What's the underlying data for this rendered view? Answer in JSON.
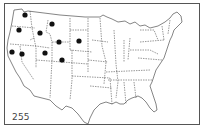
{
  "figure": {
    "type": "us-state-dot-map",
    "label": "255",
    "colors": {
      "outline": "#333333",
      "dot": "#111111",
      "background": "#ffffff",
      "frame": "#555555"
    },
    "marked_states": [
      {
        "state": "Washington",
        "x": 25,
        "y": 15
      },
      {
        "state": "Oregon",
        "x": 19,
        "y": 30
      },
      {
        "state": "Idaho",
        "x": 40,
        "y": 33
      },
      {
        "state": "Montana",
        "x": 52,
        "y": 24
      },
      {
        "state": "Wyoming",
        "x": 59,
        "y": 42
      },
      {
        "state": "South Dakota",
        "x": 79,
        "y": 41
      },
      {
        "state": "California",
        "x": 12,
        "y": 52
      },
      {
        "state": "Nevada",
        "x": 22,
        "y": 54
      },
      {
        "state": "Utah",
        "x": 45,
        "y": 53
      },
      {
        "state": "Colorado",
        "x": 62,
        "y": 60
      }
    ]
  }
}
